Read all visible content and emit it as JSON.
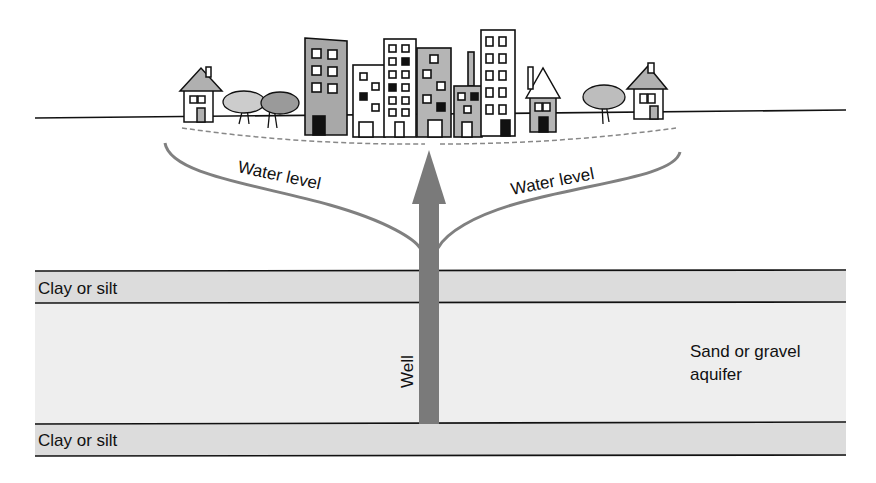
{
  "diagram": {
    "labels": {
      "water_level_left": "Water level",
      "water_level_right": "Water level",
      "well": "Well",
      "clay_top": "Clay or silt",
      "clay_bottom": "Clay or silt",
      "aquifer_line1": "Sand or gravel",
      "aquifer_line2": "aquifer"
    },
    "colors": {
      "background": "#ffffff",
      "clay_layer": "#dcdcdc",
      "aquifer_layer": "#eeeeee",
      "well_arrow": "#7a7a7a",
      "water_level_curve": "#808080",
      "building_gray": "#b5b5b5",
      "outline": "#111111"
    },
    "elements": [
      "ground-surface",
      "city-buildings",
      "houses",
      "trees",
      "original-water-table-dashed",
      "cone-of-depression-curve",
      "well-arrow",
      "clay-layer-top",
      "aquifer-layer",
      "clay-layer-bottom"
    ]
  }
}
